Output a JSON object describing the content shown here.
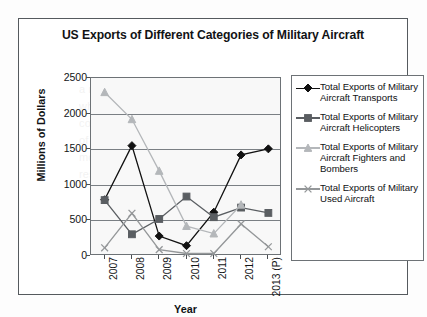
{
  "chart_data": {
    "type": "line",
    "title": "US Exports of Different Categories of Military Aircraft",
    "xlabel": "Year",
    "ylabel": "Millions of Dollars",
    "categories": [
      "2007",
      "2008",
      "2009",
      "2010",
      "2011",
      "2012",
      "2013 (P)"
    ],
    "ylim": [
      0,
      2500
    ],
    "yticks": [
      "0",
      "500",
      "1000",
      "1500",
      "2000",
      "2500"
    ],
    "ytick_values": [
      0,
      500,
      1000,
      1500,
      2000,
      2500
    ],
    "grid": true,
    "legend_position": "right",
    "series": [
      {
        "name": "Total Exports of Military Aircraft Transports",
        "marker": "diamond",
        "color": "#111111",
        "values": [
          790,
          1550,
          280,
          145,
          615,
          1420,
          1505
        ]
      },
      {
        "name": "Total Exports of Military Aircraft Helicopters",
        "marker": "square",
        "color": "#5a5e62",
        "values": [
          785,
          305,
          520,
          835,
          545,
          680,
          605
        ]
      },
      {
        "name": "Total Exports of Military Aircraft Fighters and Bombers",
        "marker": "triangle",
        "color": "#b4b7ba",
        "values": [
          2300,
          1920,
          1195,
          420,
          315,
          720,
          null
        ]
      },
      {
        "name": "Total Exports of Military Used Aircraft",
        "marker": "x",
        "color": "#949799",
        "values": [
          115,
          600,
          90,
          35,
          35,
          450,
          130
        ]
      }
    ]
  },
  "legend": {
    "items": [
      {
        "label": "Total Exports of Military Aircraft Transports"
      },
      {
        "label": "Total Exports of Military Aircraft Helicopters"
      },
      {
        "label": "Total Exports of Military Aircraft Fighters and Bombers"
      },
      {
        "label": "Total Exports of Military Used Aircraft"
      }
    ]
  },
  "background_bleed": "a resolution the the 000\nwho care and and\nconsumer shared by the require\nof the is common limited\nmore with annual in a one\nresources public in sharp 745"
}
